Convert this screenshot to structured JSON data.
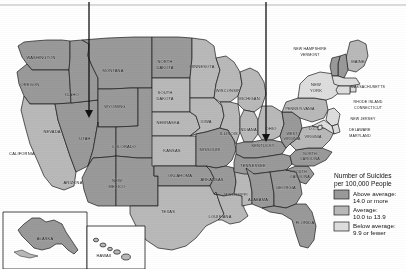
{
  "map": {
    "title": "United States suicide rate choropleth map",
    "ocean_color": "#ffffff",
    "border_color": "#1b1b1b",
    "top_rule_color": "#b9b9b9",
    "arrow_color": "#111111",
    "categories": [
      {
        "key": "above",
        "label": "Above average:",
        "range": "14.0 or more",
        "color": "#9a9a9a"
      },
      {
        "key": "average",
        "label": "Average:",
        "range": "10.0 to 13.9",
        "color": "#b9b9b9"
      },
      {
        "key": "below",
        "label": "Below average:",
        "range": "9.9 or fewer",
        "color": "#dedede"
      }
    ],
    "legend": {
      "title_line1": "Number of Suicides",
      "title_line2": "per 100,000 People"
    },
    "annotations": [
      {
        "name": "utah-pointer",
        "target": "UTAH",
        "x": 89,
        "y_from": 2,
        "y_to": 118
      },
      {
        "name": "kentucky-pointer",
        "target": "KENTUCKY",
        "x": 266,
        "y_from": 2,
        "y_to": 142
      }
    ],
    "insets": [
      {
        "name": "alaska",
        "label": "ALASKA"
      },
      {
        "name": "hawaii",
        "label": "HAWAII"
      }
    ],
    "states": [
      {
        "abbr": "WA",
        "label": "WASHINGTON",
        "cat": "above",
        "lx": 41,
        "ly": 59,
        "size": "sm"
      },
      {
        "abbr": "OR",
        "label": "OREGON",
        "cat": "above",
        "lx": 30,
        "ly": 86,
        "size": "sm"
      },
      {
        "abbr": "ID",
        "label": "IDAHO",
        "cat": "above",
        "lx": 72,
        "ly": 96,
        "size": "sm"
      },
      {
        "abbr": "MT",
        "label": "MONTANA",
        "cat": "above",
        "lx": 113,
        "ly": 72,
        "size": "sm"
      },
      {
        "abbr": "WY",
        "label": "WYOMING",
        "cat": "above",
        "lx": 115,
        "ly": 108,
        "size": "sm"
      },
      {
        "abbr": "CA",
        "label": "CALIFORNIA",
        "cat": "average",
        "lx": 22,
        "ly": 155,
        "size": "sm"
      },
      {
        "abbr": "NV",
        "label": "NEVADA",
        "cat": "above",
        "lx": 52,
        "ly": 133,
        "size": "sm"
      },
      {
        "abbr": "UT",
        "label": "UTAH",
        "cat": "above",
        "lx": 85,
        "ly": 140,
        "size": "sm"
      },
      {
        "abbr": "AZ",
        "label": "ARIZONA",
        "cat": "above",
        "lx": 73,
        "ly": 184,
        "size": "sm"
      },
      {
        "abbr": "NM",
        "label": "NEW",
        "cat": "above",
        "lx": 117,
        "ly": 182,
        "size": "sm"
      },
      {
        "abbr": "NM2",
        "label": "MEXICO",
        "cat": "above",
        "lx": 117,
        "ly": 188,
        "size": "sm"
      },
      {
        "abbr": "CO",
        "label": "COLORADO",
        "cat": "above",
        "lx": 124,
        "ly": 148,
        "size": "sm"
      },
      {
        "abbr": "ND",
        "label": "NORTH",
        "cat": "above",
        "lx": 165,
        "ly": 63,
        "size": "sm"
      },
      {
        "abbr": "ND2",
        "label": "DAKOTA",
        "cat": "above",
        "lx": 165,
        "ly": 69,
        "size": "sm"
      },
      {
        "abbr": "SD",
        "label": "SOUTH",
        "cat": "average",
        "lx": 165,
        "ly": 94,
        "size": "sm"
      },
      {
        "abbr": "SD2",
        "label": "DAKOTA",
        "cat": "average",
        "lx": 165,
        "ly": 100,
        "size": "sm"
      },
      {
        "abbr": "NE",
        "label": "NEBRASKA",
        "cat": "average",
        "lx": 168,
        "ly": 124,
        "size": "sm"
      },
      {
        "abbr": "KS",
        "label": "KANSAS",
        "cat": "average",
        "lx": 172,
        "ly": 152,
        "size": "sm"
      },
      {
        "abbr": "OK",
        "label": "OKLAHOMA",
        "cat": "above",
        "lx": 180,
        "ly": 177,
        "size": "sm"
      },
      {
        "abbr": "TX",
        "label": "TEXAS",
        "cat": "average",
        "lx": 168,
        "ly": 213,
        "size": "sm"
      },
      {
        "abbr": "MN",
        "label": "MINNESOTA",
        "cat": "average",
        "lx": 202,
        "ly": 68,
        "size": "sm"
      },
      {
        "abbr": "IA",
        "label": "IOWA",
        "cat": "average",
        "lx": 206,
        "ly": 123,
        "size": "sm"
      },
      {
        "abbr": "MO",
        "label": "MISSOURI",
        "cat": "above",
        "lx": 210,
        "ly": 151,
        "size": "sm"
      },
      {
        "abbr": "AR",
        "label": "ARKANSAS",
        "cat": "above",
        "lx": 212,
        "ly": 181,
        "size": "sm"
      },
      {
        "abbr": "LA",
        "label": "LOUISIANA",
        "cat": "average",
        "lx": 220,
        "ly": 218,
        "size": "sm"
      },
      {
        "abbr": "WI",
        "label": "WISCONSIN",
        "cat": "average",
        "lx": 228,
        "ly": 92,
        "size": "sm"
      },
      {
        "abbr": "IL",
        "label": "ILLINOIS",
        "cat": "average",
        "lx": 229,
        "ly": 135,
        "size": "sm"
      },
      {
        "abbr": "MS",
        "label": "MISSISSIPPI",
        "cat": "average",
        "lx": 236,
        "ly": 196,
        "size": "xs"
      },
      {
        "abbr": "MI",
        "label": "MICHIGAN",
        "cat": "average",
        "lx": 249,
        "ly": 100,
        "size": "sm"
      },
      {
        "abbr": "IN",
        "label": "INDIANA",
        "cat": "average",
        "lx": 248,
        "ly": 131,
        "size": "sm"
      },
      {
        "abbr": "AL",
        "label": "ALABAMA",
        "cat": "above",
        "lx": 258,
        "ly": 201,
        "size": "sm"
      },
      {
        "abbr": "TN",
        "label": "TENNESSEE",
        "cat": "above",
        "lx": 253,
        "ly": 167,
        "size": "sm"
      },
      {
        "abbr": "KY",
        "label": "KENTUCKY",
        "cat": "above",
        "lx": 263,
        "ly": 147,
        "size": "sm"
      },
      {
        "abbr": "OH",
        "label": "OHIO",
        "cat": "average",
        "lx": 271,
        "ly": 130,
        "size": "sm"
      },
      {
        "abbr": "GA",
        "label": "GEORGIA",
        "cat": "above",
        "lx": 286,
        "ly": 189,
        "size": "sm"
      },
      {
        "abbr": "FL",
        "label": "FLORIDA",
        "cat": "above",
        "lx": 305,
        "ly": 224,
        "size": "sm"
      },
      {
        "abbr": "SC",
        "label": "SOUTH",
        "cat": "above",
        "lx": 300,
        "ly": 173,
        "size": "xs"
      },
      {
        "abbr": "SC2",
        "label": "CAROLINA",
        "cat": "above",
        "lx": 300,
        "ly": 178,
        "size": "xs"
      },
      {
        "abbr": "NC",
        "label": "NORTH",
        "cat": "above",
        "lx": 310,
        "ly": 155,
        "size": "xs"
      },
      {
        "abbr": "NC2",
        "label": "CAROLINA",
        "cat": "above",
        "lx": 310,
        "ly": 160,
        "size": "xs"
      },
      {
        "abbr": "WV",
        "label": "WEST",
        "cat": "above",
        "lx": 292,
        "ly": 135,
        "size": "xs"
      },
      {
        "abbr": "WV2",
        "label": "VIRGINIA",
        "cat": "above",
        "lx": 292,
        "ly": 140,
        "size": "xs"
      },
      {
        "abbr": "VA",
        "label": "VIRGINIA",
        "cat": "average",
        "lx": 313,
        "ly": 138,
        "size": "xs"
      },
      {
        "abbr": "DC",
        "label": "D.C.",
        "cat": "below",
        "lx": 313,
        "ly": 130,
        "size": "xs"
      },
      {
        "abbr": "PA",
        "label": "PENNSYLVANIA",
        "cat": "average",
        "lx": 300,
        "ly": 110,
        "size": "xs"
      },
      {
        "abbr": "NY",
        "label": "NEW",
        "cat": "below",
        "lx": 316,
        "ly": 86,
        "size": "sm"
      },
      {
        "abbr": "NY2",
        "label": "YORK",
        "cat": "below",
        "lx": 316,
        "ly": 92,
        "size": "sm"
      },
      {
        "abbr": "ME",
        "label": "MAINE",
        "cat": "average",
        "lx": 358,
        "ly": 63,
        "size": "sm"
      },
      {
        "abbr": "NH",
        "label": "NEW HAMPSHIRE",
        "cat": "above",
        "lx": 310,
        "ly": 50,
        "size": "xs"
      },
      {
        "abbr": "VT",
        "label": "VERMONT",
        "cat": "above",
        "lx": 310,
        "ly": 56,
        "size": "xs"
      },
      {
        "abbr": "MA",
        "label": "MASSACHUSETTS",
        "cat": "below",
        "lx": 368,
        "ly": 88,
        "size": "xs"
      },
      {
        "abbr": "RI",
        "label": "RHODE ISLAND",
        "cat": "below",
        "lx": 368,
        "ly": 103,
        "size": "xs"
      },
      {
        "abbr": "CT",
        "label": "CONNECTICUT",
        "cat": "below",
        "lx": 368,
        "ly": 109,
        "size": "xs"
      },
      {
        "abbr": "NJ",
        "label": "NEW JERSEY",
        "cat": "below",
        "lx": 363,
        "ly": 120,
        "size": "xs"
      },
      {
        "abbr": "DE",
        "label": "DELAWARE",
        "cat": "below",
        "lx": 360,
        "ly": 131,
        "size": "xs"
      },
      {
        "abbr": "MD",
        "label": "MARYLAND",
        "cat": "below",
        "lx": 360,
        "ly": 137,
        "size": "xs"
      },
      {
        "abbr": "AK",
        "label": "ALASKA",
        "cat": "above",
        "lx": 45,
        "ly": 240,
        "size": "sm"
      },
      {
        "abbr": "HI",
        "label": "HAWAII",
        "cat": "average",
        "lx": 104,
        "ly": 257,
        "size": "sm"
      }
    ]
  }
}
